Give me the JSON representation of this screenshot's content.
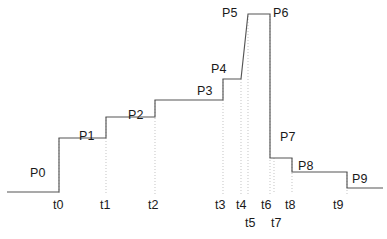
{
  "figure": {
    "type": "step-function-diagram",
    "title": "",
    "width": 387,
    "height": 239,
    "background_color": "#ffffff",
    "line_color": "#555555",
    "guide_color": "#b9b9b9",
    "text_color": "#1a1a1a"
  },
  "chart_data": {
    "type": "line",
    "title": "",
    "xlabel": "",
    "ylabel": "",
    "grid": false,
    "legend": null,
    "x": [
      "t0",
      "t1",
      "t2",
      "t3",
      "t4",
      "t5",
      "t6",
      "t7",
      "t8",
      "t9"
    ],
    "series": [
      {
        "name": "signal",
        "segments": [
          {
            "label": "P0",
            "start_time": "",
            "end_time": "t0",
            "level": 0
          },
          {
            "label": "P1",
            "start_time": "t0",
            "end_time": "t1",
            "level": 1
          },
          {
            "label": "P2",
            "start_time": "t1",
            "end_time": "t2",
            "level": 2
          },
          {
            "label": "P3",
            "start_time": "t2",
            "end_time": "t3",
            "level": 3
          },
          {
            "label": "P4",
            "start_time": "t3",
            "end_time": "t4",
            "level": 4
          },
          {
            "label": "P5",
            "start_time": "t5",
            "end_time": "t6",
            "level": 5
          },
          {
            "label": "P6",
            "start_time": "t6",
            "end_time": "t7",
            "level": 5
          },
          {
            "label": "P7",
            "start_time": "t7",
            "end_time": "t8",
            "level": -1
          },
          {
            "label": "P8",
            "start_time": "t8",
            "end_time": "t9",
            "level": -2
          },
          {
            "label": "P9",
            "start_time": "t9",
            "end_time": "",
            "level": -3
          }
        ]
      }
    ],
    "plateau_labels": [
      "P0",
      "P1",
      "P2",
      "P3",
      "P4",
      "P5",
      "P6",
      "P7",
      "P8",
      "P9"
    ],
    "time_labels": [
      "t0",
      "t1",
      "t2",
      "t3",
      "t4",
      "t5",
      "t6",
      "t7",
      "t8",
      "t9"
    ]
  },
  "plateau_labels": [
    {
      "text": "P0",
      "x": 30,
      "y": 167
    },
    {
      "text": "P1",
      "x": 79,
      "y": 130
    },
    {
      "text": "P2",
      "x": 128,
      "y": 109
    },
    {
      "text": "P3",
      "x": 197,
      "y": 85
    },
    {
      "text": "P4",
      "x": 211,
      "y": 63
    },
    {
      "text": "P5",
      "x": 222,
      "y": 7
    },
    {
      "text": "P6",
      "x": 273,
      "y": 7
    },
    {
      "text": "P7",
      "x": 280,
      "y": 131
    },
    {
      "text": "P8",
      "x": 298,
      "y": 160
    },
    {
      "text": "P9",
      "x": 352,
      "y": 173
    }
  ],
  "time_labels": [
    {
      "text": "t0",
      "x": 53,
      "y": 199
    },
    {
      "text": "t1",
      "x": 100,
      "y": 199
    },
    {
      "text": "t2",
      "x": 148,
      "y": 199
    },
    {
      "text": "t3",
      "x": 215,
      "y": 199
    },
    {
      "text": "t4",
      "x": 236,
      "y": 199
    },
    {
      "text": "t5",
      "x": 245,
      "y": 217
    },
    {
      "text": "t6",
      "x": 261,
      "y": 199
    },
    {
      "text": "t7",
      "x": 271,
      "y": 217
    },
    {
      "text": "t8",
      "x": 285,
      "y": 199
    },
    {
      "text": "t9",
      "x": 333,
      "y": 199
    }
  ],
  "geometry": {
    "signal_path": "M 7,192 L 59,192 L 59,138 L 106,138 L 106,117 L 155,117 L 155,100 L 223,100 L 223,79 L 241,79 L 248,14 L 270,14 L 270,158 L 274,158 L 292,158 L 292,172 L 347,172 L 347,188 L 383,188",
    "guides": [
      {
        "name": "guide-t0",
        "x": 59,
        "y1": 138,
        "y2": 194
      },
      {
        "name": "guide-t1",
        "x": 106,
        "y1": 117,
        "y2": 194
      },
      {
        "name": "guide-t2",
        "x": 155,
        "y1": 100,
        "y2": 194
      },
      {
        "name": "guide-t3",
        "x": 223,
        "y1": 79,
        "y2": 194
      },
      {
        "name": "guide-t4",
        "x": 241,
        "y1": 79,
        "y2": 194
      },
      {
        "name": "guide-t5",
        "x": 248,
        "y1": 16,
        "y2": 194
      },
      {
        "name": "guide-t6",
        "x": 270,
        "y1": 16,
        "y2": 194
      },
      {
        "name": "guide-t7",
        "x": 274,
        "y1": 158,
        "y2": 194
      },
      {
        "name": "guide-t8",
        "x": 292,
        "y1": 158,
        "y2": 194
      },
      {
        "name": "guide-t9",
        "x": 347,
        "y1": 172,
        "y2": 194
      }
    ]
  }
}
